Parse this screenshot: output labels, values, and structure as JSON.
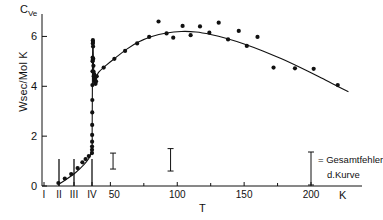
{
  "chart_data": {
    "type": "scatter",
    "title": "",
    "ylabel": "Wsec/Mol K",
    "y_axis_symbol": "C",
    "y_axis_symbol_sub": "Ve",
    "xlabel": "T",
    "x_unit": "K",
    "ylim": [
      0,
      6.9
    ],
    "yticks": [
      0,
      2,
      4,
      6
    ],
    "ytick_labels": [
      "0",
      "2",
      "4",
      "6"
    ],
    "xticks_roman": [
      "I",
      "II",
      "III",
      "IV"
    ],
    "xticks_numeric": [
      50,
      100,
      150,
      200
    ],
    "xtick_labels": [
      "I",
      "II",
      "III",
      "IV",
      "50",
      "100",
      "150",
      "200"
    ],
    "grid": false,
    "legend_position": "bottom-right",
    "annotations": [
      {
        "text": "= Gesamtfehler",
        "line": 1
      },
      {
        "text": "d.Kurve",
        "line": 2
      }
    ],
    "phase_markers": [
      {
        "label": "II",
        "x": 12
      },
      {
        "label": "III",
        "x": 20
      },
      {
        "label": "IV",
        "x": 33
      }
    ],
    "error_bars": [
      {
        "x": 52,
        "y_center": 1.0,
        "y_err": 0.32
      },
      {
        "x": 95,
        "y_center": 1.05,
        "y_err": 0.45
      }
    ],
    "series": [
      {
        "name": "curve",
        "type": "line",
        "points": [
          [
            2.0,
            0.1
          ],
          [
            3.0,
            0.55
          ],
          [
            3.8,
            1.1
          ],
          [
            4.4,
            1.6
          ],
          [
            5.0,
            2.1
          ],
          [
            5.6,
            2.7
          ],
          [
            6.2,
            3.35
          ],
          [
            6.8,
            4.0
          ],
          [
            7.4,
            4.6
          ],
          [
            8.0,
            5.1
          ],
          [
            8.8,
            5.55
          ],
          [
            9.6,
            5.8
          ],
          [
            10.5,
            5.88
          ],
          [
            11.4,
            5.8
          ],
          [
            12.4,
            5.55
          ],
          [
            13.6,
            5.2
          ],
          [
            15.0,
            4.85
          ],
          [
            16.6,
            4.6
          ],
          [
            18.4,
            4.42
          ],
          [
            20.5,
            4.3
          ],
          [
            23.0,
            4.2
          ],
          [
            26.0,
            4.13
          ],
          [
            29.0,
            4.1
          ],
          [
            32.0,
            4.15
          ],
          [
            36.0,
            4.3
          ],
          [
            41.0,
            4.55
          ],
          [
            47.0,
            4.85
          ],
          [
            54.0,
            5.15
          ],
          [
            62.0,
            5.48
          ],
          [
            71.0,
            5.78
          ],
          [
            81.0,
            6.0
          ],
          [
            92.0,
            6.14
          ],
          [
            103.0,
            6.2
          ],
          [
            114.0,
            6.18
          ],
          [
            125.0,
            6.08
          ],
          [
            137.0,
            5.92
          ],
          [
            150.0,
            5.7
          ],
          [
            164.0,
            5.42
          ],
          [
            178.0,
            5.1
          ],
          [
            192.0,
            4.75
          ],
          [
            206.0,
            4.38
          ],
          [
            218.0,
            4.05
          ],
          [
            228.0,
            3.78
          ]
        ]
      },
      {
        "name": "measurements",
        "type": "scatter",
        "points": [
          [
            1.9,
            0.12
          ],
          [
            2.3,
            0.3
          ],
          [
            2.7,
            0.48
          ],
          [
            3.1,
            0.72
          ],
          [
            3.4,
            0.95
          ],
          [
            3.6,
            1.08
          ],
          [
            3.8,
            1.2
          ],
          [
            4.0,
            1.32
          ],
          [
            4.2,
            1.45
          ],
          [
            4.4,
            1.58
          ],
          [
            4.7,
            1.78
          ],
          [
            5.0,
            2.05
          ],
          [
            5.4,
            2.45
          ],
          [
            5.9,
            2.95
          ],
          [
            6.4,
            3.45
          ],
          [
            7.0,
            4.05
          ],
          [
            7.6,
            4.6
          ],
          [
            8.2,
            5.0
          ],
          [
            8.6,
            5.15
          ],
          [
            9.2,
            5.05
          ],
          [
            9.9,
            5.72
          ],
          [
            10.4,
            5.85
          ],
          [
            10.9,
            5.78
          ],
          [
            11.6,
            5.6
          ],
          [
            13.0,
            5.1
          ],
          [
            14.2,
            4.82
          ],
          [
            15.6,
            4.58
          ],
          [
            17.2,
            4.4
          ],
          [
            18.8,
            4.44
          ],
          [
            20.2,
            4.48
          ],
          [
            21.8,
            4.3
          ],
          [
            24.0,
            4.22
          ],
          [
            26.5,
            4.15
          ],
          [
            29.5,
            4.1
          ],
          [
            33.0,
            4.2
          ],
          [
            38.0,
            4.4
          ],
          [
            45.0,
            4.75
          ],
          [
            53.0,
            5.1
          ],
          [
            61.0,
            5.42
          ],
          [
            70.0,
            5.72
          ],
          [
            79.0,
            5.98
          ],
          [
            86.0,
            6.6
          ],
          [
            92.0,
            6.12
          ],
          [
            97.0,
            5.95
          ],
          [
            104.0,
            6.42
          ],
          [
            110.0,
            6.05
          ],
          [
            117.0,
            6.4
          ],
          [
            124.0,
            6.15
          ],
          [
            131.0,
            6.55
          ],
          [
            138.0,
            5.88
          ],
          [
            146.0,
            6.22
          ],
          [
            152.0,
            5.62
          ],
          [
            160.0,
            5.98
          ],
          [
            172.0,
            4.75
          ],
          [
            188.0,
            4.72
          ],
          [
            202.0,
            4.7
          ],
          [
            220.0,
            4.05
          ]
        ]
      }
    ]
  }
}
